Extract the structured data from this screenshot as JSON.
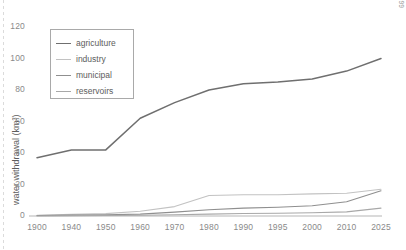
{
  "figure": {
    "source_note": "Source: Shiklomanov 1999"
  },
  "legend": {
    "items": [
      {
        "label": "agriculture",
        "color": "#6f6f6f"
      },
      {
        "label": "industry",
        "color": "#c2c2c2"
      },
      {
        "label": "municipal",
        "color": "#8f8f8f"
      },
      {
        "label": "reservoirs",
        "color": "#a8a8a8"
      }
    ]
  },
  "chart_data": {
    "type": "line",
    "title": "",
    "xlabel": "",
    "ylabel": "water withdrawal (km³)",
    "x": [
      1900,
      1940,
      1950,
      1960,
      1970,
      1980,
      1990,
      1995,
      2000,
      2010,
      2025
    ],
    "xtick_labels": [
      "1900",
      "1940",
      "1950",
      "1960",
      "1970",
      "1980",
      "1990",
      "1995",
      "2000",
      "2010",
      "2025"
    ],
    "ytick_labels": [
      "0",
      "20",
      "40",
      "60",
      "80",
      "100",
      "120"
    ],
    "yticks": [
      0,
      20,
      40,
      60,
      80,
      100,
      120
    ],
    "ylim": [
      0,
      120
    ],
    "grid": false,
    "legend_position": "upper-left",
    "series": [
      {
        "name": "agriculture",
        "color": "#6f6f6f",
        "values": [
          37,
          42,
          42,
          62,
          72,
          80,
          84,
          85,
          87,
          92,
          100
        ]
      },
      {
        "name": "industry",
        "color": "#c2c2c2",
        "values": [
          0.5,
          1,
          1.5,
          3,
          6,
          13,
          13.5,
          13.5,
          14,
          14.5,
          17
        ]
      },
      {
        "name": "municipal",
        "color": "#8f8f8f",
        "values": [
          0.3,
          0.6,
          0.8,
          1.2,
          2.5,
          4,
          5,
          5.5,
          6.5,
          9,
          16
        ]
      },
      {
        "name": "reservoirs",
        "color": "#a8a8a8",
        "values": [
          0,
          0.2,
          0.3,
          0.5,
          0.8,
          1.2,
          1.6,
          1.8,
          2,
          2.6,
          5
        ]
      }
    ]
  }
}
